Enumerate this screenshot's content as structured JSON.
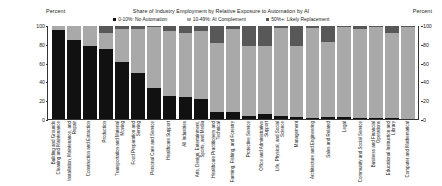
{
  "chart_data": {
    "type": "bar",
    "subtype": "stacked-percent-column",
    "title": "Share of Industry Employment by Relative Exposure to Automation by AI",
    "xlabel": "",
    "ylabel": "Percent",
    "ylabel_right": "Percent",
    "ylim": [
      0,
      100
    ],
    "yticks": [
      0,
      20,
      40,
      60,
      80,
      100
    ],
    "grid": false,
    "legend_position": "top-center",
    "series": [
      {
        "name": "0-10%: No Automation",
        "color": "#111111",
        "values": [
          96,
          85,
          78,
          75,
          61,
          50,
          33,
          25,
          24,
          22,
          8,
          8,
          3,
          5,
          3,
          2,
          1,
          2,
          2,
          1,
          1,
          1,
          0
        ]
      },
      {
        "name": "10-49%: AI Complement",
        "color": "#a9a9a9",
        "values": [
          4,
          15,
          22,
          18,
          36,
          47,
          66,
          70,
          68,
          73,
          74,
          89,
          76,
          73,
          95,
          76,
          97,
          81,
          97,
          96,
          98,
          92,
          99
        ]
      },
      {
        "name": "50%+: Likely Replacement",
        "color": "#585858",
        "values": [
          0,
          0,
          0,
          7,
          3,
          3,
          1,
          5,
          8,
          5,
          18,
          3,
          21,
          22,
          2,
          22,
          2,
          17,
          1,
          3,
          1,
          7,
          1
        ]
      }
    ],
    "categories": [
      "Building and Grounds Cleaning and Maintenance",
      "Installation, Maintenance, and Repair",
      "Construction and Extraction",
      "Production",
      "Transportation and Material Moving",
      "Food Preparation and Serving",
      "Personal Care and Service",
      "Healthcare Support",
      "All Industries",
      "Arts, Design, Entertainment, Sports, and Media",
      "Healthcare Practitioners and Technical",
      "Farming, Fishing, and Forestry",
      "Protective Service",
      "Office and Administrative Support",
      "Life, Physical, and Social Science",
      "Management",
      "Architecture and Engineering",
      "Sales and Related",
      "Legal",
      "Community and Social Service",
      "Business and Financial Operations",
      "Educational Instruction and Library",
      "Computer and Mathematical"
    ],
    "category_lines": [
      [
        "Building and Grounds",
        "Cleaning and Maintenance"
      ],
      [
        "Installation, Maintenance, and",
        "Repair"
      ],
      [
        "Construction and Extraction"
      ],
      [
        "Production"
      ],
      [
        "Transportation and Material",
        "Moving"
      ],
      [
        "Food Preparation and",
        "Serving"
      ],
      [
        "Personal Care and Service"
      ],
      [
        "Healthcare Support"
      ],
      [
        "All Industries"
      ],
      [
        "Arts, Design, Entertainment,",
        "Sports, and Media"
      ],
      [
        "Healthcare Practitioners and",
        "Technical"
      ],
      [
        "Farming, Fishing, and Forestry"
      ],
      [
        "Protective Service"
      ],
      [
        "Office and Administrative",
        "Support"
      ],
      [
        "Life, Physical, and Social",
        "Science"
      ],
      [
        "Management"
      ],
      [
        "Architecture and Engineering"
      ],
      [
        "Sales and Related"
      ],
      [
        "Legal"
      ],
      [
        "Community and Social Service"
      ],
      [
        "Business and Financial",
        "Operations"
      ],
      [
        "Educational Instruction and",
        "Library"
      ],
      [
        "Computer and Mathematical"
      ]
    ]
  },
  "axes": {
    "left_unit": "Percent",
    "right_unit": "Percent"
  },
  "colors": {
    "no_automation": "#111111",
    "ai_complement": "#a9a9a9",
    "likely_replacement": "#585858",
    "axis": "#333333",
    "text": "#222222",
    "background": "#ffffff"
  }
}
